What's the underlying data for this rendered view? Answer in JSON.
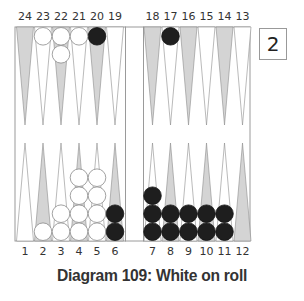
{
  "diagram": {
    "caption": "Diagram 109: White on roll",
    "cube_value": "2",
    "colors": {
      "board_border": "#9a9a9a",
      "dark_point": "#d4d4d4",
      "light_point": "#ffffff",
      "white_checker": "#ffffff",
      "black_checker": "#1e1e1e",
      "label": "#333333"
    },
    "top_labels_left": [
      "24",
      "23",
      "22",
      "21",
      "20",
      "19"
    ],
    "top_labels_right": [
      "18",
      "17",
      "16",
      "15",
      "14",
      "13"
    ],
    "bottom_labels_left": [
      "1",
      "2",
      "3",
      "4",
      "5",
      "6"
    ],
    "bottom_labels_right": [
      "7",
      "8",
      "9",
      "10",
      "11",
      "12"
    ],
    "points": {
      "1": {
        "white": 0,
        "black": 0
      },
      "2": {
        "white": 1,
        "black": 0
      },
      "3": {
        "white": 2,
        "black": 0
      },
      "4": {
        "white": 4,
        "black": 0
      },
      "5": {
        "white": 4,
        "black": 0
      },
      "6": {
        "white": 0,
        "black": 2
      },
      "7": {
        "white": 0,
        "black": 3
      },
      "8": {
        "white": 0,
        "black": 2
      },
      "9": {
        "white": 0,
        "black": 2
      },
      "10": {
        "white": 0,
        "black": 2
      },
      "11": {
        "white": 0,
        "black": 2
      },
      "12": {
        "white": 0,
        "black": 0
      },
      "13": {
        "white": 0,
        "black": 0
      },
      "14": {
        "white": 0,
        "black": 0
      },
      "15": {
        "white": 0,
        "black": 0
      },
      "16": {
        "white": 0,
        "black": 0
      },
      "17": {
        "white": 0,
        "black": 1
      },
      "18": {
        "white": 0,
        "black": 0
      },
      "19": {
        "white": 0,
        "black": 0
      },
      "20": {
        "white": 0,
        "black": 1
      },
      "21": {
        "white": 1,
        "black": 0
      },
      "22": {
        "white": 2,
        "black": 0
      },
      "23": {
        "white": 1,
        "black": 0
      },
      "24": {
        "white": 0,
        "black": 0
      }
    }
  }
}
